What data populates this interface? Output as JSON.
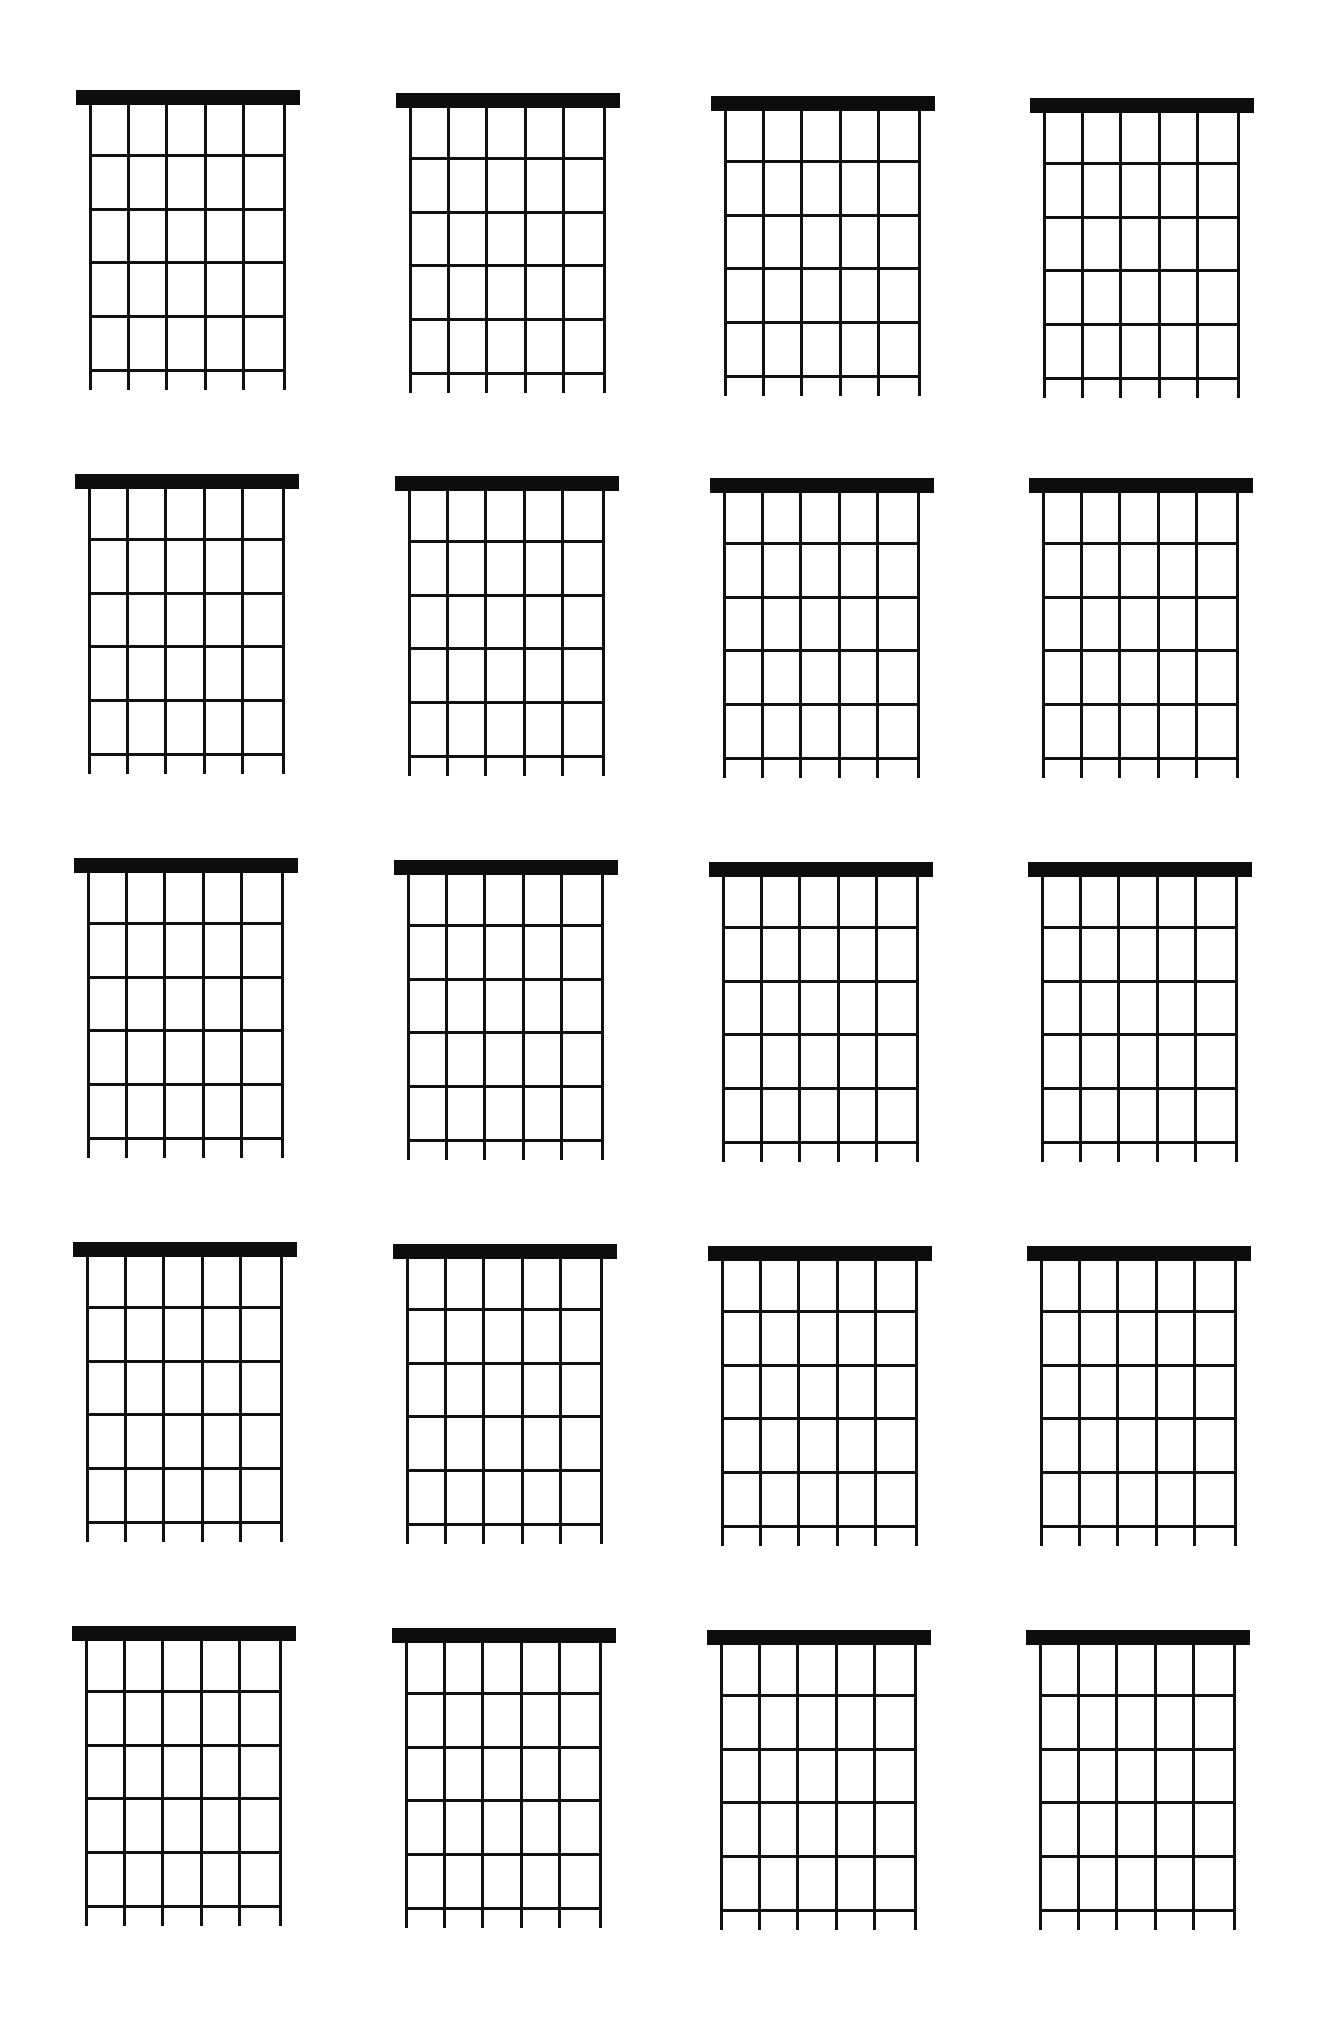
{
  "page": {
    "title": "",
    "background": "#ffffff",
    "ink_color": "#111111"
  },
  "layout": {
    "columns": 4,
    "rows": 5,
    "column_lefts": [
      76,
      396,
      711,
      1030
    ],
    "row_tops": [
      90,
      474,
      858,
      1242,
      1626
    ],
    "row_skew": [
      [
        0,
        3,
        6,
        8
      ],
      [
        0,
        2,
        4,
        4
      ],
      [
        0,
        2,
        4,
        4
      ],
      [
        0,
        2,
        4,
        4
      ],
      [
        0,
        2,
        4,
        4
      ]
    ]
  },
  "diagram": {
    "strings": 6,
    "frets": 5,
    "nut_height": 15,
    "width": 224,
    "string_positions": [
      13,
      51,
      89,
      128,
      166,
      207
    ],
    "fret_positions": [
      64,
      118,
      171,
      225,
      279
    ],
    "string_length_below_last_fret": 21,
    "markers": []
  },
  "chord_diagrams": [
    {
      "row": 1,
      "col": 1,
      "chord_name": "",
      "markers": []
    },
    {
      "row": 1,
      "col": 2,
      "chord_name": "",
      "markers": []
    },
    {
      "row": 1,
      "col": 3,
      "chord_name": "",
      "markers": []
    },
    {
      "row": 1,
      "col": 4,
      "chord_name": "",
      "markers": []
    },
    {
      "row": 2,
      "col": 1,
      "chord_name": "",
      "markers": []
    },
    {
      "row": 2,
      "col": 2,
      "chord_name": "",
      "markers": []
    },
    {
      "row": 2,
      "col": 3,
      "chord_name": "",
      "markers": []
    },
    {
      "row": 2,
      "col": 4,
      "chord_name": "",
      "markers": []
    },
    {
      "row": 3,
      "col": 1,
      "chord_name": "",
      "markers": []
    },
    {
      "row": 3,
      "col": 2,
      "chord_name": "",
      "markers": []
    },
    {
      "row": 3,
      "col": 3,
      "chord_name": "",
      "markers": []
    },
    {
      "row": 3,
      "col": 4,
      "chord_name": "",
      "markers": []
    },
    {
      "row": 4,
      "col": 1,
      "chord_name": "",
      "markers": []
    },
    {
      "row": 4,
      "col": 2,
      "chord_name": "",
      "markers": []
    },
    {
      "row": 4,
      "col": 3,
      "chord_name": "",
      "markers": []
    },
    {
      "row": 4,
      "col": 4,
      "chord_name": "",
      "markers": []
    },
    {
      "row": 5,
      "col": 1,
      "chord_name": "",
      "markers": []
    },
    {
      "row": 5,
      "col": 2,
      "chord_name": "",
      "markers": []
    },
    {
      "row": 5,
      "col": 3,
      "chord_name": "",
      "markers": []
    },
    {
      "row": 5,
      "col": 4,
      "chord_name": "",
      "markers": []
    }
  ]
}
